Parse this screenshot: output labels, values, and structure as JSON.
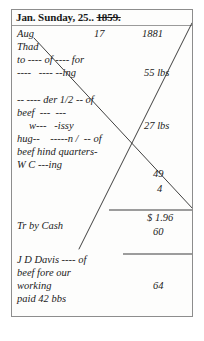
{
  "document": {
    "type": "handwritten-ledger-page",
    "header": {
      "date_text": "Jan. Sunday, 25..",
      "struck_year": "1859."
    },
    "top_row": {
      "month": "Aug",
      "day": "17",
      "year": "1881"
    },
    "entries": [
      {
        "lines": [
          "Thad",
          "to ---- of ---- for",
          "----   ---- --ing"
        ],
        "amount": "55 lbs"
      },
      {
        "lines": [
          "-- ---- der 1/2 -- of",
          "beef  ---  ---",
          "    w---   -issy",
          "hug--    -----n /  -- of",
          "beef hind quarters-",
          "W C ---ing"
        ],
        "amount": "27 lbs"
      }
    ],
    "body_lines": [
      {
        "text": "Thad",
        "x": 5,
        "y": 31
      },
      {
        "text": "to ---- of ---- for",
        "x": 5,
        "y": 44
      },
      {
        "text": "----   ---- --ing",
        "x": 5,
        "y": 57
      },
      {
        "text": "-- ---- der 1/2 -- of",
        "x": 5,
        "y": 84
      },
      {
        "text": "beef  ---  ---",
        "x": 5,
        "y": 97
      },
      {
        "text": "w---   -issy",
        "x": 17,
        "y": 110
      },
      {
        "text": "hug--    -----n /  -- of",
        "x": 5,
        "y": 123
      },
      {
        "text": "beef hind quarters-",
        "x": 5,
        "y": 136
      },
      {
        "text": "W C ---ing",
        "x": 5,
        "y": 149
      },
      {
        "text": "Tr by Cash",
        "x": 5,
        "y": 210
      },
      {
        "text": "J D Davis ---- of",
        "x": 5,
        "y": 244
      },
      {
        "text": "beef fore our",
        "x": 5,
        "y": 257
      },
      {
        "text": "working",
        "x": 5,
        "y": 270
      },
      {
        "text": "paid 42 bbs",
        "x": 5,
        "y": 283
      }
    ],
    "value_column": [
      {
        "text": "55 lbs",
        "x": 132,
        "y": 57
      },
      {
        "text": "27 lbs",
        "x": 132,
        "y": 110
      },
      {
        "text": "49",
        "x": 141,
        "y": 158
      },
      {
        "text": "4",
        "x": 145,
        "y": 173
      },
      {
        "text": "$ 1.96",
        "x": 135,
        "y": 202
      },
      {
        "text": "60",
        "x": 141,
        "y": 216
      },
      {
        "text": "64",
        "x": 141,
        "y": 270
      }
    ],
    "top_row_positions": [
      {
        "text": "Aug",
        "x": 5,
        "y": 18
      },
      {
        "text": "17",
        "x": 82,
        "y": 18
      },
      {
        "text": "1881",
        "x": 130,
        "y": 18
      }
    ],
    "rules": [
      {
        "name": "subtotal-rule",
        "x1": 97,
        "y": 200,
        "x2": 182
      },
      {
        "name": "total-rule",
        "x1": 111,
        "y": 244,
        "x2": 182
      }
    ],
    "cross_out_lines": [
      {
        "name": "cross-out-descending",
        "x1": 22,
        "y1": 28,
        "x2": 181,
        "y2": 199
      },
      {
        "name": "cross-out-ascending",
        "x1": 67,
        "y1": 239,
        "x2": 180,
        "y2": 13
      }
    ],
    "colors": {
      "paper": "#fdfdfc",
      "ink": "#1b1b1b",
      "border": "#8d8d8d",
      "rule": "#4a4a4a"
    }
  }
}
